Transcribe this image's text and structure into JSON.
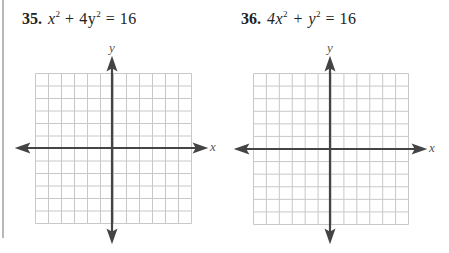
{
  "problems": [
    {
      "number": "35.",
      "equation_parts": [
        "x",
        "2",
        " + 4y",
        "2",
        " = 16"
      ],
      "equation_text": "x^2 + 4y^2 = 16",
      "graph": {
        "grid_cells_x": 12,
        "grid_cells_y": 12,
        "x_axis_label": "x",
        "y_axis_label": "y"
      }
    },
    {
      "number": "36.",
      "equation_parts": [
        "4x",
        "2",
        " + y",
        "2",
        " = 16"
      ],
      "equation_text": "4x^2 + y^2 = 16",
      "graph": {
        "grid_cells_x": 12,
        "grid_cells_y": 12,
        "x_axis_label": "x",
        "y_axis_label": "y"
      }
    }
  ],
  "colors": {
    "grid_line": "#c8c8c8",
    "axis": "#444444",
    "page_border": "#b8b8b8"
  }
}
